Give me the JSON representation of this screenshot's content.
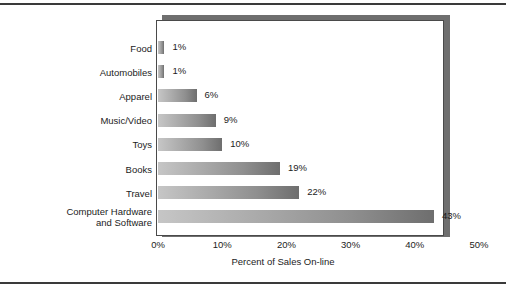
{
  "chart_data": {
    "type": "bar",
    "orientation": "horizontal",
    "title": "",
    "xlabel": "Percent of Sales On-line",
    "ylabel": "",
    "xlim": [
      0,
      50
    ],
    "grid": false,
    "legend": null,
    "xticks": [
      "0%",
      "10%",
      "20%",
      "30%",
      "40%",
      "50%"
    ],
    "xtick_values": [
      0,
      10,
      20,
      30,
      40,
      50
    ],
    "categories": [
      "Food",
      "Automobiles",
      "Apparel",
      "Music/Video",
      "Toys",
      "Books",
      "Travel",
      "Computer Hardware\nand Software"
    ],
    "values": [
      1,
      1,
      6,
      9,
      10,
      19,
      22,
      43
    ],
    "data_labels": [
      "1%",
      "1%",
      "6%",
      "9%",
      "10%",
      "19%",
      "22%",
      "43%"
    ],
    "bar_gradient_start": "#c6c6c6",
    "bar_gradient_end": "#6e6e6e",
    "frame_color": "#4a4a4a",
    "shadow_color": "#6f6f6f",
    "text_color": "#1c1c1c"
  }
}
